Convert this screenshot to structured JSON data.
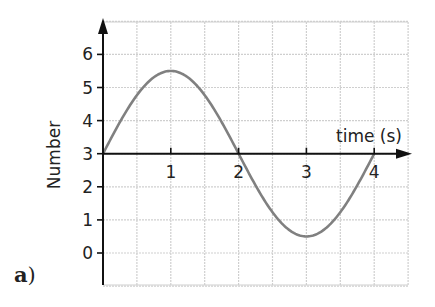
{
  "part_label": {
    "letter": "a",
    "paren": ")"
  },
  "chart_data": {
    "type": "line",
    "title": "",
    "xlabel": "time (s)",
    "ylabel": "Number",
    "x_ticks": [
      "1",
      "2",
      "3",
      "4"
    ],
    "y_ticks": [
      "0",
      "1",
      "2",
      "3",
      "4",
      "5",
      "6"
    ],
    "xlim": [
      0,
      4.5
    ],
    "ylim": [
      -1,
      7
    ],
    "x_axis_crosses_y_at": 3,
    "grid": true,
    "grid_step_x": 0.5,
    "grid_step_y": 1,
    "legend": null,
    "series": [
      {
        "name": "Number",
        "function": "3 + 2.5*sin(pi*t/2)",
        "x": [
          0,
          0.5,
          1,
          1.5,
          2,
          2.5,
          3,
          3.5,
          4
        ],
        "values": [
          3,
          4.77,
          5.5,
          4.77,
          3,
          1.23,
          0.5,
          1.23,
          3
        ],
        "color": "#808080"
      }
    ]
  },
  "colors": {
    "grid": "#cfcfcf",
    "axis": "#111111",
    "curve": "#808080",
    "text": "#222222"
  }
}
